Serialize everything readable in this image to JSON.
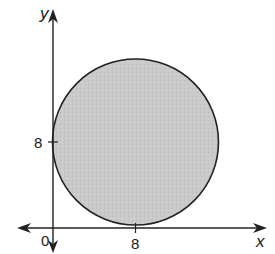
{
  "diagram": {
    "type": "coordinate-plane-circle",
    "axes": {
      "x_label": "x",
      "y_label": "y",
      "origin_label": "0"
    },
    "ticks": {
      "x_tick_label": "8",
      "y_tick_label": "8"
    },
    "circle": {
      "center": [
        8,
        8
      ],
      "radius": 8,
      "fill": "#c8c8c8",
      "stroke": "#222222"
    },
    "colors": {
      "axis": "#222222",
      "background": "#ffffff"
    }
  }
}
